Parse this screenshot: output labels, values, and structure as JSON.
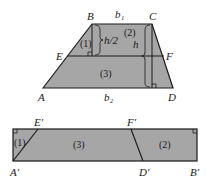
{
  "diagram": {
    "fill_color": "#a6a6a6",
    "stroke_color": "#1a1a1a",
    "background": "#ffffff",
    "trapezoid": {
      "vertices": {
        "A": {
          "label": "A",
          "x": 43,
          "y": 88
        },
        "B": {
          "label": "B",
          "x": 92,
          "y": 24
        },
        "C": {
          "label": "C",
          "x": 152,
          "y": 24
        },
        "D": {
          "label": "D",
          "x": 173,
          "y": 88
        },
        "E": {
          "label": "E",
          "x": 68,
          "y": 56
        },
        "F": {
          "label": "F",
          "x": 164,
          "y": 56
        }
      },
      "labels": {
        "top_base": "b₁",
        "bottom_base": "b₂",
        "half_height": "h/2",
        "height": "h",
        "region1": "(1)",
        "region2": "(2)",
        "region3": "(3)"
      }
    },
    "rectangle": {
      "vertices": {
        "A_prime": {
          "label": "A′",
          "x": 13,
          "y": 161
        },
        "E_prime": {
          "label": "E′",
          "x": 38,
          "y": 129
        },
        "F_prime": {
          "label": "F′",
          "x": 131,
          "y": 129
        },
        "D_prime": {
          "label": "D′",
          "x": 143,
          "y": 161
        },
        "B_prime": {
          "label": "B′",
          "x": 197,
          "y": 161
        }
      },
      "labels": {
        "region1": "(1)",
        "region2": "(2)",
        "region3": "(3)"
      }
    }
  }
}
